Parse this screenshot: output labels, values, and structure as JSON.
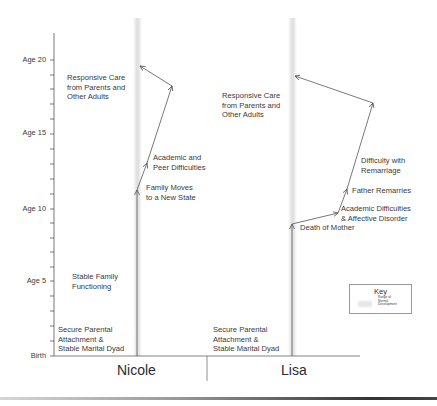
{
  "axis": {
    "labels": [
      "Age 20",
      "Age 15",
      "Age 10",
      "Age 5",
      "Birth"
    ]
  },
  "subjects": [
    {
      "name": "Nicole",
      "labels": {
        "responsive_care": [
          "Responsive Care",
          "from Parents and",
          "Other Adults"
        ],
        "academic_peer": [
          "Academic and",
          "Peer Difficulties"
        ],
        "family_moves": [
          "Family Moves",
          "to a New State"
        ],
        "stable_family": [
          "Stable Family",
          "Functioning"
        ],
        "secure_attachment": [
          "Secure Parental",
          "Attachment &",
          "Stable Marital Dyad"
        ]
      }
    },
    {
      "name": "Lisa",
      "labels": {
        "responsive_care": [
          "Responsive Care",
          "from Parents and",
          "Other Adults"
        ],
        "difficulty_remarriage": [
          "Difficulty with",
          "Remarriage"
        ],
        "father_remarries": [
          "Father Remarries"
        ],
        "academic_affective": [
          "Academic Difficulties",
          "& Affective Disorder"
        ],
        "death_of_mother": [
          "Death of Mother"
        ],
        "secure_attachment": [
          "Secure Parental",
          "Attachment &",
          "Stable Marital Dyad"
        ]
      }
    }
  ],
  "key": {
    "title": "Key",
    "item": [
      "Range of",
      "Normal",
      "Development"
    ]
  },
  "colors": {
    "line": "#555555",
    "band": "#dcdcdc",
    "text": "#3a3a3a"
  }
}
